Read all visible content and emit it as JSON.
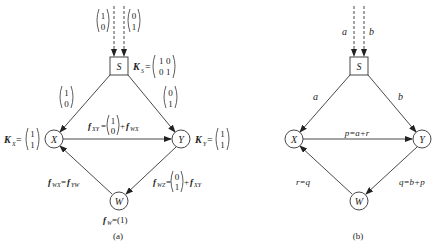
{
  "figure": {
    "panel_a": {
      "caption": "(a)",
      "nodes": {
        "S": "S",
        "X": "X",
        "Y": "Y",
        "W": "W"
      },
      "inputs": {
        "left": [
          "1",
          "0"
        ],
        "right": [
          "0",
          "1"
        ]
      },
      "K_S": {
        "label": "K",
        "sub": "S",
        "matrix": [
          [
            "1",
            "0"
          ],
          [
            "0",
            "1"
          ]
        ]
      },
      "K_X": {
        "label": "K",
        "sub": "X",
        "vector": [
          "1",
          "1"
        ]
      },
      "K_Y": {
        "label": "K",
        "sub": "Y",
        "vector": [
          "1",
          "1"
        ]
      },
      "edge_SX": [
        "1",
        "0"
      ],
      "edge_SY": [
        "0",
        "1"
      ],
      "f_XY": {
        "lhs": "f",
        "lhs_sub": "XY",
        "vector": [
          "1",
          "0"
        ],
        "plus": "+",
        "rhs": "f",
        "rhs_sub": "WX"
      },
      "f_WX": {
        "lhs": "f",
        "lhs_sub": "WX",
        "eq": "=",
        "rhs": "f",
        "rhs_sub": "YW"
      },
      "f_WZ": {
        "lhs": "f",
        "lhs_sub": "WZ",
        "vector": [
          "0",
          "1"
        ],
        "plus": "+",
        "rhs": "f",
        "rhs_sub": "XY"
      },
      "f_W": {
        "lhs": "f",
        "lhs_sub": "W",
        "rhs": "=(1)"
      }
    },
    "panel_b": {
      "caption": "(b)",
      "nodes": {
        "S": "S",
        "X": "X",
        "Y": "Y",
        "W": "W"
      },
      "inputs": {
        "left": "a",
        "right": "b"
      },
      "edge_SX": "a",
      "edge_SY": "b",
      "edge_XY": "p=a+r",
      "edge_WX": "r=q",
      "edge_YW": "q=b+p"
    }
  }
}
